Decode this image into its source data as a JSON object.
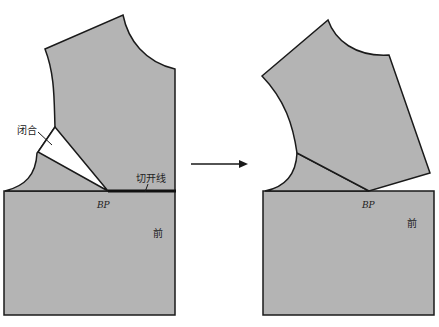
{
  "labels": {
    "closed": "闭合",
    "cut_line": "切开线",
    "bp_left": "BP",
    "bp_right": "BP",
    "front_left": "前",
    "front_right": "前"
  },
  "colors": {
    "fill": "#b4b4b4",
    "stroke": "#1a1a1a",
    "dart": "#ffffff",
    "background": "#ffffff"
  },
  "arrow": {
    "direction": "right"
  }
}
